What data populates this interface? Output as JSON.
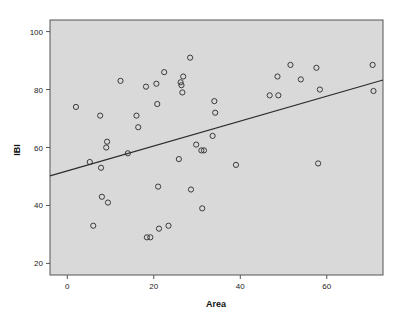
{
  "chart_data": {
    "type": "scatter",
    "title": "",
    "xlabel": "Area",
    "ylabel": "IBI",
    "xlim": [
      -4,
      73
    ],
    "ylim": [
      16,
      104
    ],
    "xticks": [
      0,
      20,
      40,
      60
    ],
    "yticks": [
      20,
      40,
      60,
      80,
      100
    ],
    "xtick_labels": [
      "0",
      "20",
      "40",
      "60"
    ],
    "ytick_labels": [
      "20",
      "40",
      "60",
      "80",
      "100"
    ],
    "grid": false,
    "legend": null,
    "plot_background": "#d9d9d9",
    "figure_background": "#ffffff",
    "marker_style": "open-circle",
    "marker_color": "#3a3a3a",
    "series": [
      {
        "name": "IBI vs Area",
        "points": [
          [
            2.0,
            74.0
          ],
          [
            5.2,
            55.0
          ],
          [
            6.0,
            33.0
          ],
          [
            7.6,
            71.0
          ],
          [
            7.8,
            53.0
          ],
          [
            8.0,
            43.0
          ],
          [
            9.2,
            62.0
          ],
          [
            9.0,
            60.0
          ],
          [
            9.4,
            41.0
          ],
          [
            12.3,
            83.0
          ],
          [
            14.0,
            58.0
          ],
          [
            16.0,
            71.0
          ],
          [
            16.4,
            67.0
          ],
          [
            18.2,
            81.0
          ],
          [
            18.4,
            29.0
          ],
          [
            19.2,
            29.0
          ],
          [
            20.6,
            82.0
          ],
          [
            20.8,
            75.0
          ],
          [
            21.0,
            46.5
          ],
          [
            21.2,
            32.0
          ],
          [
            22.4,
            86.0
          ],
          [
            23.4,
            33.0
          ],
          [
            25.8,
            56.0
          ],
          [
            26.2,
            82.5
          ],
          [
            26.4,
            81.5
          ],
          [
            26.6,
            79.0
          ],
          [
            26.8,
            84.5
          ],
          [
            28.4,
            91.0
          ],
          [
            28.6,
            45.5
          ],
          [
            29.8,
            61.0
          ],
          [
            31.0,
            59.0
          ],
          [
            31.6,
            59.0
          ],
          [
            31.2,
            39.0
          ],
          [
            33.6,
            64.0
          ],
          [
            34.0,
            76.0
          ],
          [
            34.2,
            72.0
          ],
          [
            39.0,
            54.0
          ],
          [
            46.8,
            78.0
          ],
          [
            48.8,
            78.0
          ],
          [
            48.6,
            84.5
          ],
          [
            51.6,
            88.5
          ],
          [
            54.0,
            83.5
          ],
          [
            57.6,
            87.5
          ],
          [
            58.4,
            80.0
          ],
          [
            58.0,
            54.5
          ],
          [
            70.6,
            88.5
          ],
          [
            70.8,
            79.5
          ]
        ]
      }
    ],
    "fit_line": {
      "type": "linear",
      "x_start": -4.0,
      "y_start": 50.2,
      "x_end": 73.0,
      "y_end": 83.3,
      "color": "#2b2b2b"
    }
  }
}
